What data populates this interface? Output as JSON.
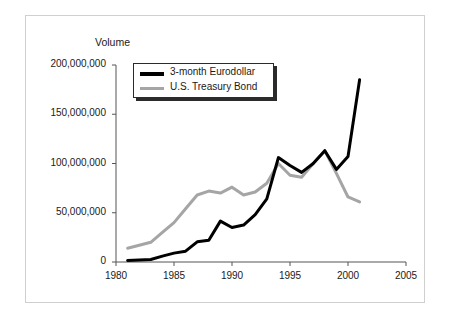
{
  "figure": {
    "border_color": "#cfcfcf"
  },
  "chart_data": {
    "type": "line",
    "title": "",
    "subtitle": "",
    "ylabel": "Volume",
    "xlabel": "",
    "xlim": [
      1980,
      2005
    ],
    "ylim": [
      0,
      200000000
    ],
    "grid": false,
    "legend_position": "top-left-inside",
    "xticks": [
      "1980",
      "1985",
      "1990",
      "1995",
      "2000",
      "2005"
    ],
    "xtick_values": [
      1980,
      1985,
      1990,
      1995,
      2000,
      2005
    ],
    "yticks": [
      "0",
      "50,000,000",
      "100,000,000",
      "150,000,000",
      "200,000,000"
    ],
    "ytick_values": [
      0,
      50000000,
      100000000,
      150000000,
      200000000
    ],
    "x": [
      1981,
      1982,
      1983,
      1984,
      1985,
      1986,
      1987,
      1988,
      1989,
      1990,
      1991,
      1992,
      1993,
      1994,
      1995,
      1996,
      1997,
      1998,
      1999,
      2000,
      2001
    ],
    "series": [
      {
        "name": "3-month Eurodollar",
        "color": "#000000",
        "width": 3,
        "values": [
          1500000,
          2000000,
          2500000,
          6000000,
          9000000,
          11000000,
          20500000,
          22000000,
          41500000,
          35000000,
          37500000,
          48000000,
          64000000,
          106000000,
          98000000,
          91000000,
          100000000,
          113000000,
          94000000,
          107000000,
          185000000
        ]
      },
      {
        "name": "U.S. Treasury Bond",
        "color": "#a5a5a5",
        "width": 3,
        "values": [
          14000000,
          17000000,
          20000000,
          30000000,
          40000000,
          54000000,
          68000000,
          72000000,
          70000000,
          76000000,
          68000000,
          71000000,
          80000000,
          100000000,
          88000000,
          86000000,
          100000000,
          113000000,
          90000000,
          66000000,
          61000000
        ]
      }
    ]
  },
  "legend": {
    "items": [
      {
        "label": "3-month Eurodollar",
        "color": "#000000"
      },
      {
        "label": "U.S. Treasury Bond",
        "color": "#a5a5a5"
      }
    ]
  }
}
